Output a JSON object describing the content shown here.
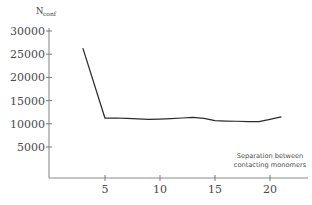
{
  "chart_data": {
    "type": "line",
    "title": "",
    "xlabel": "Separation between contacting monomers",
    "ylabel": "N_conf",
    "ylabel_main": "N",
    "ylabel_sub": "conf",
    "xlim": [
      0,
      22
    ],
    "ylim": [
      0,
      30000
    ],
    "grid": false,
    "legend": null,
    "xticks": [
      5,
      10,
      15,
      20
    ],
    "xtick_labels": [
      "5",
      "10",
      "15",
      "20"
    ],
    "yticks": [
      5000,
      10000,
      15000,
      20000,
      25000,
      30000
    ],
    "ytick_labels": [
      "5000",
      "10000",
      "15000",
      "20000",
      "25000",
      "30000"
    ],
    "annotations": [
      {
        "name": "xaxis-caption",
        "line1": "Separation between",
        "line2": "contacting monomers"
      }
    ],
    "series": [
      {
        "name": "Nconf",
        "color": "#2b2b2b",
        "x": [
          3,
          5,
          6,
          7,
          8,
          9,
          10,
          11,
          12,
          13,
          14,
          15,
          16,
          17,
          18,
          19,
          20,
          21
        ],
        "values": [
          26200,
          11200,
          11250,
          11150,
          11050,
          10950,
          11000,
          11100,
          11250,
          11400,
          11150,
          10700,
          10600,
          10550,
          10450,
          10450,
          10950,
          11500
        ]
      }
    ]
  },
  "colors": {
    "line": "#2b2b2b",
    "axis": "#8c8c8c",
    "tick_text": "#4a4a4a",
    "background": "#ffffff"
  }
}
